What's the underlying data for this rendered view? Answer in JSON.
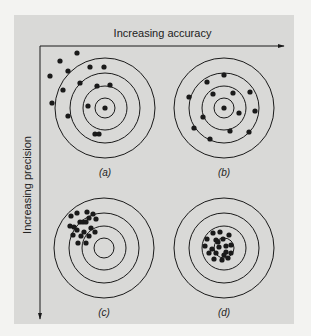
{
  "figure": {
    "x_axis_label": "Increasing accuracy",
    "y_axis_label": "Increasing precision",
    "colors": {
      "panel": "#d9d9d7",
      "ink": "#1a1a1a",
      "background": "#f3f3f1"
    },
    "ring_radii": [
      10,
      22,
      35,
      50
    ],
    "targets": [
      {
        "id": "a",
        "caption": "(a)",
        "cx": 105,
        "cy": 108,
        "description": "low accuracy, low precision",
        "shots": [
          [
            77,
            53
          ],
          [
            60,
            61
          ],
          [
            50,
            76
          ],
          [
            68,
            71
          ],
          [
            90,
            67
          ],
          [
            104,
            67
          ],
          [
            80,
            83
          ],
          [
            63,
            90
          ],
          [
            97,
            86
          ],
          [
            110,
            85
          ],
          [
            88,
            106
          ],
          [
            105,
            108
          ],
          [
            52,
            103
          ],
          [
            68,
            116
          ],
          [
            95,
            134
          ],
          [
            99,
            134
          ]
        ]
      },
      {
        "id": "b",
        "caption": "(b)",
        "cx": 224,
        "cy": 108,
        "description": "high accuracy, low precision",
        "shots": [
          [
            224,
            75
          ],
          [
            207,
            82
          ],
          [
            189,
            97
          ],
          [
            213,
            94
          ],
          [
            233,
            93
          ],
          [
            250,
            92
          ],
          [
            255,
            111
          ],
          [
            239,
            113
          ],
          [
            224,
            108
          ],
          [
            203,
            117
          ],
          [
            194,
            128
          ],
          [
            230,
            131
          ],
          [
            249,
            132
          ],
          [
            210,
            139
          ]
        ]
      },
      {
        "id": "c",
        "caption": "(c)",
        "cx": 104,
        "cy": 248,
        "description": "low accuracy, high precision",
        "shots": [
          [
            77,
            213
          ],
          [
            80,
            222
          ],
          [
            87,
            212
          ],
          [
            84,
            232
          ],
          [
            83,
            222
          ],
          [
            89,
            218
          ],
          [
            91,
            228
          ],
          [
            93,
            214
          ],
          [
            96,
            219
          ],
          [
            71,
            216
          ],
          [
            74,
            227
          ],
          [
            70,
            226
          ],
          [
            77,
            230
          ],
          [
            86,
            222
          ],
          [
            81,
            236
          ],
          [
            89,
            236
          ],
          [
            95,
            232
          ],
          [
            73,
            235
          ],
          [
            78,
            243
          ],
          [
            86,
            243
          ]
        ]
      },
      {
        "id": "d",
        "caption": "(d)",
        "cx": 224,
        "cy": 248,
        "description": "high accuracy, high precision",
        "shots": [
          [
            213,
            233
          ],
          [
            220,
            232
          ],
          [
            207,
            239
          ],
          [
            216,
            240
          ],
          [
            223,
            239
          ],
          [
            229,
            235
          ],
          [
            205,
            246
          ],
          [
            212,
            249
          ],
          [
            219,
            247
          ],
          [
            226,
            246
          ],
          [
            231,
            245
          ],
          [
            209,
            253
          ],
          [
            216,
            253
          ],
          [
            224,
            255
          ],
          [
            231,
            253
          ],
          [
            214,
            259
          ],
          [
            222,
            260
          ],
          [
            228,
            258
          ],
          [
            218,
            242
          ],
          [
            226,
            252
          ]
        ]
      }
    ]
  }
}
